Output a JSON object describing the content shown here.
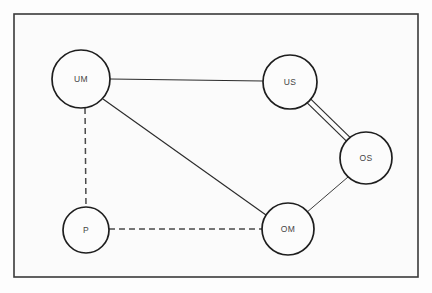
{
  "diagram": {
    "type": "node-link-graph",
    "background_color": "#fdfdfd",
    "canvas": {
      "width": 432,
      "height": 293
    },
    "frame": {
      "name": "outer-border",
      "x": 14,
      "y": 14,
      "width": 404,
      "height": 263,
      "stroke_color": "#3a3a3a",
      "fill_color": "#fbfbfb"
    },
    "nodes": [
      {
        "id": "UM",
        "label": "UM",
        "cx": 81,
        "cy": 79,
        "r": 29,
        "stroke_color": "#1e1e1e",
        "fill_color": "#fcfcfc"
      },
      {
        "id": "US",
        "label": "US",
        "cx": 290,
        "cy": 82,
        "r": 27,
        "stroke_color": "#1e1e1e",
        "fill_color": "#fcfcfc"
      },
      {
        "id": "OS",
        "label": "OS",
        "cx": 366,
        "cy": 158,
        "r": 26,
        "stroke_color": "#1e1e1e",
        "fill_color": "#fcfcfc"
      },
      {
        "id": "OM",
        "label": "OM",
        "cx": 288,
        "cy": 229,
        "r": 26,
        "stroke_color": "#1e1e1e",
        "fill_color": "#fcfcfc"
      },
      {
        "id": "P",
        "label": "P",
        "cx": 86,
        "cy": 230,
        "r": 23,
        "stroke_color": "#1e1e1e",
        "fill_color": "#fcfcfc"
      }
    ],
    "edges": [
      {
        "id": "UM-US",
        "source": "UM",
        "target": "US",
        "style": "solid",
        "x1": 110,
        "y1": 79,
        "x2": 263,
        "y2": 81,
        "stroke_color": "#2b2b2b"
      },
      {
        "id": "UM-OM",
        "source": "UM",
        "target": "OM",
        "style": "solid",
        "x1": 103,
        "y1": 99,
        "x2": 266,
        "y2": 215,
        "stroke_color": "#2b2b2b"
      },
      {
        "id": "UM-P",
        "source": "UM",
        "target": "P",
        "style": "dashed",
        "x1": 85,
        "y1": 108,
        "x2": 86,
        "y2": 207,
        "stroke_color": "#4a4a4a"
      },
      {
        "id": "P-OM",
        "source": "P",
        "target": "OM",
        "style": "dashed",
        "x1": 109,
        "y1": 229,
        "x2": 262,
        "y2": 229,
        "stroke_color": "#4a4a4a"
      },
      {
        "id": "US-OS",
        "source": "US",
        "target": "OS",
        "style": "double",
        "x1": 309,
        "y1": 101,
        "x2": 348,
        "y2": 139,
        "offset": 2.6,
        "stroke_color": "#2b2b2b"
      },
      {
        "id": "OS-OM",
        "source": "OS",
        "target": "OM",
        "style": "solid",
        "x1": 348,
        "y1": 177,
        "x2": 306,
        "y2": 213,
        "stroke_color": "#3c3c3c"
      }
    ]
  }
}
